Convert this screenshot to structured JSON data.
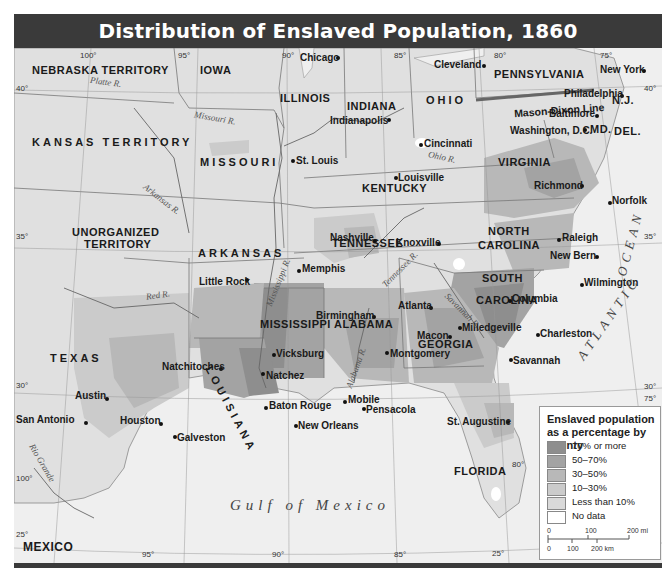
{
  "title": "Distribution of Enslaved Population, 1860",
  "legend": {
    "title": "Enslaved population as a percentage by county",
    "items": [
      {
        "label": "70% or more",
        "color": "#8e8e8e"
      },
      {
        "label": "50–70%",
        "color": "#a3a3a3"
      },
      {
        "label": "30–50%",
        "color": "#b8b8b8"
      },
      {
        "label": "10–30%",
        "color": "#cbcbcb"
      },
      {
        "label": "Less than 10%",
        "color": "#d9d9d9"
      },
      {
        "label": "No data",
        "color": "#ffffff"
      }
    ],
    "scale": {
      "mi_ticks": [
        "0",
        "100",
        "200 mi"
      ],
      "km_ticks": [
        "0",
        "100",
        "200 km"
      ]
    }
  },
  "states": {
    "nebraska": "NEBRASKA TERRITORY",
    "iowa": "IOWA",
    "illinois": "ILLINOIS",
    "indiana": "INDIANA",
    "ohio": "OHIO",
    "pennsylvania": "PENNSYLVANIA",
    "nj": "N.J.",
    "md": "MD.",
    "del": "DEL.",
    "kansas": "KANSAS TERRITORY",
    "missouri": "MISSOURI",
    "kentucky": "KENTUCKY",
    "virginia": "VIRGINIA",
    "unorganized1": "UNORGANIZED",
    "unorganized2": "TERRITORY",
    "arkansas": "ARKANSAS",
    "tennessee": "TENNESSEE",
    "north_carolina1": "NORTH",
    "north_carolina2": "CAROLINA",
    "south_carolina1": "SOUTH",
    "south_carolina2": "CAROLINA",
    "mississippi": "MISSISSIPPI",
    "alabama": "ALABAMA",
    "georgia": "GEORGIA",
    "texas": "TEXAS",
    "louisiana": "LOUISIANA",
    "florida": "FLORIDA",
    "mexico": "MEXICO"
  },
  "cities": {
    "chicago": "Chicago",
    "cleveland": "Cleveland",
    "new_york": "New York",
    "philadelphia": "Philadelphia",
    "baltimore": "Baltimore",
    "washington": "Washington, D.C.",
    "indianapolis": "Indianapolis",
    "cincinnati": "Cincinnati",
    "st_louis": "St. Louis",
    "louisville": "Louisville",
    "richmond": "Richmond",
    "norfolk": "Norfolk",
    "nashville": "Nashville",
    "knoxville": "Knoxville",
    "raleigh": "Raleigh",
    "new_bern": "New Bern",
    "memphis": "Memphis",
    "little_rock": "Little Rock",
    "wilmington": "Wilmington",
    "columbia": "Columbia",
    "atlanta": "Atlanta",
    "birmingham": "Birmingham",
    "charleston": "Charleston",
    "milledgeville": "Milledgeville",
    "macon": "Macon",
    "vicksburg": "Vicksburg",
    "montgomery": "Montgomery",
    "natchitoches": "Natchitoches",
    "natchez": "Natchez",
    "savannah": "Savannah",
    "austin": "Austin",
    "baton_rouge": "Baton Rouge",
    "mobile": "Mobile",
    "pensacola": "Pensacola",
    "san_antonio": "San Antonio",
    "houston": "Houston",
    "new_orleans": "New Orleans",
    "st_augustine": "St. Augustine",
    "galveston": "Galveston"
  },
  "features": {
    "mason_dixon": "Mason-Dixon Line",
    "atlantic": "ATLANTIC",
    "ocean": "OCEAN",
    "gulf": "Gulf of Mexico"
  },
  "rivers": {
    "platte": "Platte R.",
    "missouri": "Missouri R.",
    "ohio": "Ohio R.",
    "arkansas": "Arkansas R.",
    "red": "Red R.",
    "mississippi": "Mississippi R.",
    "tennessee": "Tennessee R.",
    "savannah": "Savannah R.",
    "alabama": "Alabama R.",
    "rio_grande": "Rio Grande"
  },
  "graticule": {
    "top": [
      "100°",
      "95°",
      "90°",
      "85°",
      "80°",
      "75°"
    ],
    "bottom": [
      "95°",
      "90°",
      "85°"
    ],
    "lat_left": [
      "40°",
      "35°",
      "30°",
      "25°"
    ],
    "lat_right": [
      "40°",
      "35°",
      "30°"
    ],
    "misc": {
      "lon100_low": "100°",
      "lon80_fl": "80°",
      "lon75_right": "75°",
      "lat25_fl": "25°"
    }
  }
}
